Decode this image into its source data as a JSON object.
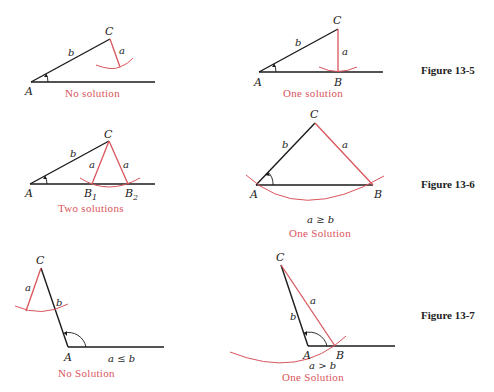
{
  "figures": [
    {
      "label": "Figure 13-5",
      "cases": [
        {
          "id": "fig13-5-left",
          "caption": "No solution",
          "points": {
            "A": "A",
            "C": "C"
          },
          "sides": {
            "a": "a",
            "b": "b"
          }
        },
        {
          "id": "fig13-5-right",
          "caption": "One solution",
          "points": {
            "A": "A",
            "B": "B",
            "C": "C"
          },
          "sides": {
            "a": "a",
            "b": "b"
          }
        }
      ]
    },
    {
      "label": "Figure 13-6",
      "cases": [
        {
          "id": "fig13-6-left",
          "caption": "Two solutions",
          "points": {
            "A": "A",
            "B1": "B",
            "B1_sub": "1",
            "B2": "B",
            "B2_sub": "2",
            "C": "C"
          },
          "sides": {
            "a1": "a",
            "a2": "a",
            "b": "b"
          }
        },
        {
          "id": "fig13-6-right",
          "caption": "One Solution",
          "condition": "a ≥ b",
          "points": {
            "A": "A",
            "B": "B",
            "C": "C"
          },
          "sides": {
            "a": "a",
            "b": "b"
          }
        }
      ]
    },
    {
      "label": "Figure 13-7",
      "cases": [
        {
          "id": "fig13-7-left",
          "caption": "No Solution",
          "condition": "a ≤ b",
          "points": {
            "A": "A",
            "C": "C"
          },
          "sides": {
            "a": "a",
            "b": "b"
          }
        },
        {
          "id": "fig13-7-right",
          "caption": "One Solution",
          "condition": "a > b",
          "points": {
            "A": "A",
            "B": "B",
            "C": "C"
          },
          "sides": {
            "a": "a",
            "b": "b"
          }
        }
      ]
    }
  ],
  "colors": {
    "accent_red": "#d9545c",
    "line_black": "#1a1a1a"
  }
}
